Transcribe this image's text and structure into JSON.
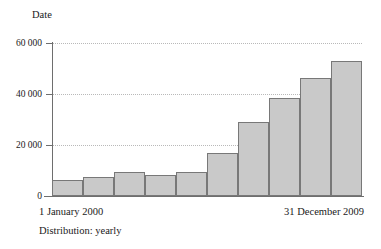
{
  "chart_data": {
    "type": "bar",
    "title": "",
    "ylabel": "Date",
    "xlabel": "",
    "grid": true,
    "legend": "none",
    "ylim": [
      0,
      60000
    ],
    "ytick_labels": [
      "60 000",
      "40 000",
      "20 000",
      "0"
    ],
    "ytick_values": [
      60000,
      40000,
      20000,
      0
    ],
    "categories": [
      "2000",
      "2001",
      "2002",
      "2003",
      "2004",
      "2005",
      "2006",
      "2007",
      "2008",
      "2009"
    ],
    "values": [
      6300,
      7300,
      9400,
      8100,
      9400,
      16700,
      29000,
      38400,
      46200,
      52900
    ],
    "annotations": {
      "range_start": "1 January 2000",
      "range_end": "31 December 2009",
      "distribution": "Distribution: yearly"
    },
    "colors": {
      "bar_fill": "#c9c9c9",
      "bar_stroke": "#787878",
      "axis": "#6e6e6e",
      "gridline": "#b9b9b9",
      "text": "#1a1a1a"
    }
  }
}
